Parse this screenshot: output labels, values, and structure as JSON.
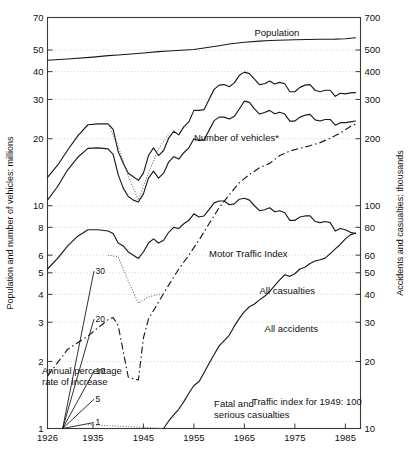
{
  "chart_data": {
    "type": "line",
    "title": "",
    "xlabel": "",
    "ylabel": "Population and number of vehicles: millions",
    "ylabel_right": "Accidents and casualties: thousands",
    "scale": "log",
    "grid": true,
    "xlim": [
      1926,
      1988
    ],
    "ylim": [
      1,
      70
    ],
    "ylim_right": [
      10,
      700
    ],
    "xticks": [
      1926,
      1935,
      1945,
      1955,
      1965,
      1975,
      1985
    ],
    "xtick_labels": [
      "1926",
      "1935",
      "1945",
      "1955",
      "1965",
      "1975",
      "1985"
    ],
    "yticks_left": [
      1,
      2,
      3,
      4,
      5,
      6,
      8,
      10,
      20,
      30,
      40,
      50,
      70
    ],
    "ytick_labels_left": [
      "1",
      "2",
      "3",
      "4",
      "5",
      "6",
      "8",
      "10",
      "20",
      "30",
      "40",
      "50",
      "70"
    ],
    "yticks_right": [
      10,
      20,
      30,
      40,
      50,
      60,
      80,
      100,
      200,
      300,
      400,
      500,
      700
    ],
    "ytick_labels_right": [
      "10",
      "20",
      "30",
      "40",
      "50",
      "60",
      "80",
      "100",
      "200",
      "300",
      "400",
      "500",
      "700"
    ],
    "gridlines_left": [
      2,
      3,
      4,
      5,
      6,
      8,
      10,
      20,
      30,
      40,
      50
    ],
    "annotations": {
      "fan_title_line1": "Annual percentage",
      "fan_title_line2": "rate of increase",
      "fan_labels": [
        "30",
        "20",
        "10",
        "5",
        "1"
      ],
      "traffic_index_note": "Traffic index for 1949: 100"
    },
    "legend_position": "inline",
    "series": [
      {
        "name": "Population",
        "label": "Population",
        "axis": "left",
        "style": "solid",
        "label_x": 1967,
        "label_y": 58,
        "x": [
          1926,
          1930,
          1935,
          1938,
          1940,
          1945,
          1948,
          1950,
          1955,
          1960,
          1962,
          1965,
          1968,
          1970,
          1975,
          1980,
          1983,
          1985,
          1987
        ],
        "values": [
          45.0,
          45.6,
          46.5,
          47.2,
          47.5,
          48.5,
          49.2,
          49.5,
          50.3,
          52.3,
          53.2,
          54.2,
          54.8,
          55.2,
          55.6,
          55.9,
          56.0,
          56.2,
          56.8
        ]
      },
      {
        "name": "All casualties",
        "label": "All casualties",
        "axis": "right",
        "style": "solid",
        "label_x": 1968,
        "label_y": 40,
        "x": [
          1926,
          1928,
          1930,
          1932,
          1934,
          1936,
          1938,
          1939,
          1940,
          1941,
          1942,
          1943,
          1944,
          1945,
          1946,
          1947,
          1948,
          1949,
          1950,
          1951,
          1952,
          1953,
          1954,
          1955,
          1956,
          1957,
          1958,
          1959,
          1960,
          1961,
          1962,
          1963,
          1964,
          1965,
          1966,
          1967,
          1968,
          1969,
          1970,
          1971,
          1972,
          1973,
          1974,
          1975,
          1976,
          1977,
          1978,
          1979,
          1980,
          1981,
          1982,
          1983,
          1984,
          1985,
          1986,
          1987
        ],
        "values": [
          134,
          152,
          178,
          206,
          231,
          233,
          233,
          220,
          175,
          155,
          140,
          135,
          130,
          140,
          168,
          182,
          168,
          177,
          201,
          216,
          208,
          226,
          238,
          268,
          268,
          270,
          300,
          333,
          348,
          350,
          342,
          356,
          385,
          398,
          392,
          370,
          350,
          353,
          363,
          352,
          358,
          353,
          325,
          325,
          340,
          348,
          350,
          330,
          325,
          330,
          330,
          310,
          320,
          318,
          321,
          322
        ]
      },
      {
        "name": "All accidents",
        "label": "All accidents",
        "axis": "right",
        "style": "solid",
        "label_x": 1969,
        "label_y": 27,
        "x": [
          1926,
          1928,
          1930,
          1932,
          1934,
          1936,
          1938,
          1939,
          1940,
          1941,
          1942,
          1943,
          1944,
          1945,
          1946,
          1947,
          1948,
          1949,
          1950,
          1951,
          1952,
          1953,
          1954,
          1955,
          1956,
          1957,
          1958,
          1959,
          1960,
          1961,
          1962,
          1963,
          1964,
          1965,
          1966,
          1967,
          1968,
          1969,
          1970,
          1971,
          1972,
          1973,
          1974,
          1975,
          1976,
          1977,
          1978,
          1979,
          1980,
          1981,
          1982,
          1983,
          1984,
          1985,
          1986,
          1987
        ],
        "values": [
          106,
          122,
          145,
          165,
          181,
          182,
          180,
          170,
          138,
          120,
          110,
          106,
          104,
          113,
          133,
          143,
          133,
          140,
          157,
          166,
          162,
          173,
          182,
          200,
          196,
          198,
          218,
          241,
          250,
          250,
          245,
          252,
          272,
          295,
          291,
          272,
          258,
          262,
          268,
          259,
          263,
          258,
          240,
          240,
          250,
          255,
          257,
          243,
          240,
          244,
          244,
          230,
          236,
          236,
          238,
          240
        ]
      },
      {
        "name": "Number of vehicles",
        "label": "Number of vehicles*",
        "axis": "left",
        "style": "dash-dot",
        "label_x": 1955,
        "label_y": 19.5,
        "x": [
          1926,
          1930,
          1934,
          1938,
          1939,
          1940,
          1942,
          1944,
          1945,
          1946,
          1948,
          1950,
          1952,
          1954,
          1956,
          1958,
          1960,
          1962,
          1964,
          1966,
          1968,
          1970,
          1972,
          1974,
          1976,
          1978,
          1980,
          1982,
          1984,
          1986,
          1987
        ],
        "values": [
          1.72,
          2.27,
          2.6,
          3.08,
          3.15,
          2.9,
          1.7,
          1.65,
          2.55,
          3.1,
          3.7,
          4.4,
          5.2,
          6.0,
          7.0,
          8.3,
          9.8,
          11.2,
          12.7,
          13.8,
          14.8,
          15.5,
          16.8,
          17.6,
          18.1,
          18.6,
          19.2,
          20.1,
          21.2,
          22.7,
          23.2
        ]
      },
      {
        "name": "Fatal and serious casualties",
        "label": "Fatal and\nserious casualties",
        "axis": "right",
        "style": "solid",
        "label_x": 1959,
        "label_y": 12.5,
        "x": [
          1926,
          1928,
          1930,
          1932,
          1934,
          1936,
          1938,
          1939,
          1940,
          1941,
          1942,
          1943,
          1944,
          1945,
          1946,
          1947,
          1948,
          1949,
          1950,
          1951,
          1952,
          1953,
          1954,
          1955,
          1956,
          1957,
          1958,
          1959,
          1960,
          1961,
          1962,
          1963,
          1964,
          1965,
          1966,
          1967,
          1968,
          1969,
          1970,
          1971,
          1972,
          1973,
          1974,
          1975,
          1976,
          1977,
          1978,
          1979,
          1980,
          1981,
          1982,
          1983,
          1984,
          1985,
          1986,
          1987
        ],
        "values": [
          52,
          58,
          66,
          73,
          78,
          78,
          77,
          75,
          68,
          66,
          62,
          60,
          58,
          62,
          68,
          71,
          68,
          70,
          76,
          80,
          79,
          83,
          86,
          92,
          89,
          90,
          96,
          103,
          105,
          105,
          101,
          102,
          107,
          108,
          106,
          100,
          95,
          96,
          98,
          94,
          95,
          93,
          86,
          86,
          89,
          90,
          90,
          85,
          84,
          85,
          84,
          77,
          79,
          78,
          76,
          75
        ]
      },
      {
        "name": "Motor Traffic Index",
        "label": "Motor Traffic Index",
        "axis": "left",
        "style": "solid",
        "label_x": 1958,
        "label_y": 5.9,
        "note": "Traffic index for 1949: 100",
        "x": [
          1949,
          1950,
          1951,
          1952,
          1953,
          1954,
          1955,
          1956,
          1957,
          1958,
          1959,
          1960,
          1961,
          1962,
          1963,
          1964,
          1965,
          1966,
          1967,
          1968,
          1969,
          1970,
          1971,
          1972,
          1973,
          1974,
          1975,
          1976,
          1977,
          1978,
          1979,
          1980,
          1981,
          1982,
          1983,
          1984,
          1985,
          1986,
          1987
        ],
        "values": [
          1.0,
          1.08,
          1.15,
          1.22,
          1.32,
          1.44,
          1.56,
          1.62,
          1.78,
          1.96,
          2.15,
          2.35,
          2.48,
          2.62,
          2.88,
          3.12,
          3.35,
          3.52,
          3.62,
          3.78,
          3.92,
          4.12,
          4.38,
          4.65,
          4.9,
          4.82,
          4.95,
          5.2,
          5.3,
          5.5,
          5.65,
          5.72,
          5.82,
          6.1,
          6.4,
          6.7,
          7.1,
          7.4,
          7.55
        ]
      },
      {
        "name": "Vehicles wartime dotted",
        "label": "",
        "axis": "left",
        "style": "dotted",
        "x": [
          1938,
          1940,
          1942,
          1944,
          1946,
          1948,
          1949
        ],
        "values": [
          6.0,
          5.9,
          4.6,
          3.65,
          3.9,
          4.0,
          4.02
        ]
      },
      {
        "name": "Casualties wartime dotted",
        "label": "",
        "axis": "right",
        "style": "dotted",
        "x": [
          1938,
          1940,
          1942,
          1944,
          1946,
          1948,
          1950
        ],
        "values": [
          234,
          185,
          136,
          106,
          140,
          180,
          210
        ]
      },
      {
        "name": "Baseline dotted",
        "label": "",
        "axis": "left",
        "style": "dotted",
        "x": [
          1934,
          1938,
          1942,
          1946,
          1949
        ],
        "values": [
          1.04,
          1.03,
          1.02,
          1.01,
          1.0
        ]
      },
      {
        "name": "Annual percentage rate of increase fan",
        "label": "Annual percentage rate of increase",
        "axis": "left",
        "style": "rays",
        "origin_x": 1929,
        "origin_y": 1.0,
        "rates": [
          30,
          20,
          10,
          5,
          1
        ]
      }
    ]
  }
}
